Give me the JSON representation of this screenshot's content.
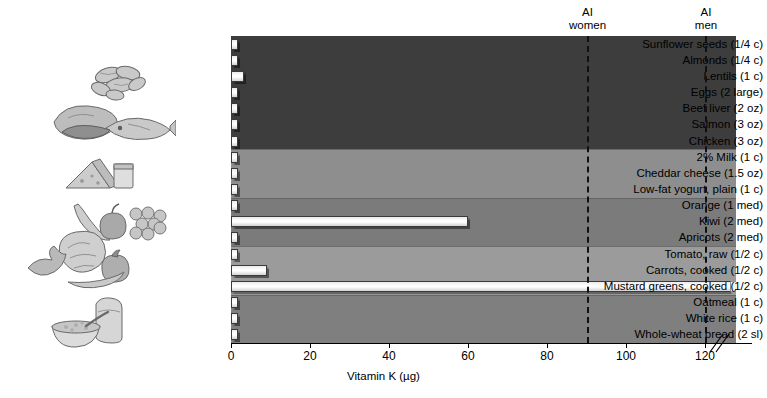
{
  "chart_data": {
    "type": "bar",
    "orientation": "horizontal",
    "title": "",
    "xlabel": "Vitamin K (µg)",
    "ylabel": "",
    "xlim": [
      0,
      120
    ],
    "xticks": [
      0,
      20,
      40,
      60,
      80,
      100,
      120
    ],
    "xtick_labels": [
      "0",
      "20",
      "40",
      "60",
      "80",
      "100",
      "120"
    ],
    "axis_break": true,
    "axis_break_at": 122,
    "grid": false,
    "legend": "none",
    "categories": [
      "Sunflower seeds (1/4 c)",
      "Almonds (1/4 c)",
      "Lentils (1 c)",
      "Eggs (2 large)",
      "Beef liver (2 oz)",
      "Salmon (3 oz)",
      "Chicken (3 oz)",
      "2% Milk (1 c)",
      "Cheddar cheese (1.5 oz)",
      "Low-fat yogurt, plain (1 c)",
      "Orange (1 med)",
      "Kiwi (2 med)",
      "Apricots (2 med)",
      "Tomato, raw (1/2 c)",
      "Carrots, cooked (1/2 c)",
      "Mustard greens, cooked (1/2 c)",
      "Oatmeal (1 c)",
      "White rice (1 c)",
      "Whole-wheat bread (2 sl)"
    ],
    "values": [
      1.0,
      0.8,
      3.2,
      0.6,
      0.5,
      0.7,
      0.5,
      0.6,
      0.9,
      0.5,
      1.2,
      60.0,
      1.0,
      1.1,
      9.0,
      130.0,
      0.8,
      0.5,
      1.0
    ],
    "value_is_clipped": [
      false,
      false,
      false,
      false,
      false,
      false,
      false,
      false,
      false,
      false,
      false,
      false,
      false,
      false,
      false,
      true,
      false,
      false,
      false
    ],
    "reference_lines": [
      {
        "label_line1": "AI",
        "label_line2": "women",
        "value": 90
      },
      {
        "label_line1": "AI",
        "label_line2": "men",
        "value": 120
      }
    ],
    "groups": [
      {
        "name": "protein-foods",
        "start": 0,
        "end": 6,
        "color": "#3d3d3d"
      },
      {
        "name": "dairy",
        "start": 7,
        "end": 9,
        "color": "#8e8e8e"
      },
      {
        "name": "fruits",
        "start": 10,
        "end": 12,
        "color": "#7b7b7b"
      },
      {
        "name": "vegetables",
        "start": 13,
        "end": 15,
        "color": "#9b9b9b"
      },
      {
        "name": "grains",
        "start": 16,
        "end": 18,
        "color": "#7f7f7f"
      }
    ]
  },
  "illustrations": [
    {
      "name": "legumes-illustration",
      "alt": "lentils"
    },
    {
      "name": "meat-fish-illustration",
      "alt": "beef liver, salmon, chicken"
    },
    {
      "name": "dairy-illustration",
      "alt": "cheese and milk"
    },
    {
      "name": "fruits-illustration",
      "alt": "banana, apple, grapes"
    },
    {
      "name": "vegetables-illustration",
      "alt": "leafy greens, carrot, tomato"
    },
    {
      "name": "grains-illustration",
      "alt": "bread and oatmeal bowl"
    }
  ],
  "colors": {
    "background": "#ffffff",
    "bar_fill": "#ffffff",
    "bar_outline": "#3a3a3a",
    "axis": "#000000",
    "reference_line": "#111111"
  }
}
